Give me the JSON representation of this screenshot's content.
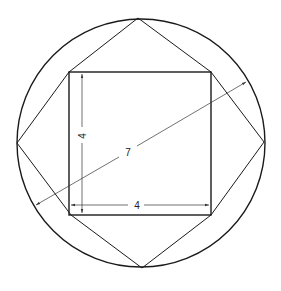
{
  "diagram": {
    "labels": {
      "square_height": "4",
      "square_width": "4",
      "diagonal": "7"
    },
    "colors": {
      "stroke": "#1a1a1a",
      "dimension": "#333333",
      "background": "#ffffff"
    },
    "geometry": {
      "circle": {
        "cx": 141,
        "cy": 143,
        "r": 124
      },
      "square": {
        "x1": 69,
        "y1": 72,
        "x2": 211,
        "y2": 215
      },
      "octagon_points": [
        [
          138,
          18
        ],
        [
          211,
          72
        ],
        [
          264,
          142
        ],
        [
          211,
          215
        ],
        [
          142,
          268
        ],
        [
          71,
          215
        ],
        [
          17,
          143
        ],
        [
          69,
          72
        ]
      ]
    }
  }
}
